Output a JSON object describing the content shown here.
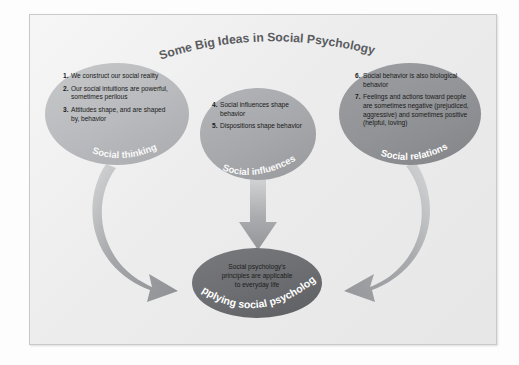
{
  "figure": {
    "title": "Some Big Ideas in Social Psychology",
    "background_color": "#ececed",
    "frame_border_color": "#c9c9ca"
  },
  "ellipses": [
    {
      "id": "social-thinking",
      "label": "Social thinking",
      "fill_color": "#b9bbbd",
      "items": [
        {
          "number": "1.",
          "text": "We construct our social reality"
        },
        {
          "number": "2.",
          "text": "Our social intuitions are powerful, sometimes perilous"
        },
        {
          "number": "3.",
          "text": "Attitudes shape, and are shaped by, behavior"
        }
      ]
    },
    {
      "id": "social-influences",
      "label": "Social influences",
      "fill_color": "#a9abad",
      "items": [
        {
          "number": "4.",
          "text": "Social influences shape behavior"
        },
        {
          "number": "5.",
          "text": "Dispositions shape behavior"
        }
      ]
    },
    {
      "id": "social-relations",
      "label": "Social relations",
      "fill_color": "#949699",
      "items": [
        {
          "number": "6.",
          "text": "Social behavior is also biological behavior"
        },
        {
          "number": "7.",
          "text": "Feelings and actions toward people are sometimes negative (prejudiced, aggressive) and sometimes positive (helpful, loving)"
        }
      ]
    }
  ],
  "center": {
    "id": "applying-social-psychology",
    "label": "Applying social psychology",
    "fill_color": "#6e7073",
    "lines": [
      "Social psychology's",
      "principles are applicable",
      "to everyday life"
    ]
  },
  "arrows": [
    {
      "id": "arrow-left",
      "from": "social-thinking",
      "to": "applying-social-psychology",
      "shape": "curved"
    },
    {
      "id": "arrow-middle",
      "from": "social-influences",
      "to": "applying-social-psychology",
      "shape": "straight-down"
    },
    {
      "id": "arrow-right",
      "from": "social-relations",
      "to": "applying-social-psychology",
      "shape": "curved"
    }
  ]
}
